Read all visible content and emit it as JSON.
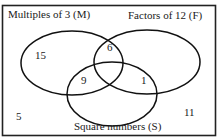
{
  "diagram": {
    "type": "venn",
    "sets": [
      {
        "id": "M",
        "label": "Multiples of 3 (M)"
      },
      {
        "id": "F",
        "label": "Factors of 12 (F)"
      },
      {
        "id": "S",
        "label": "Square numbers (S)"
      }
    ],
    "regions": {
      "M_only": "15",
      "M_and_F_only": "6",
      "M_and_S_only": "9",
      "F_and_S_only": "1",
      "outside": "5",
      "outside_right": "11"
    },
    "colors": {
      "line": "#111111",
      "background": "#ffffff"
    }
  }
}
